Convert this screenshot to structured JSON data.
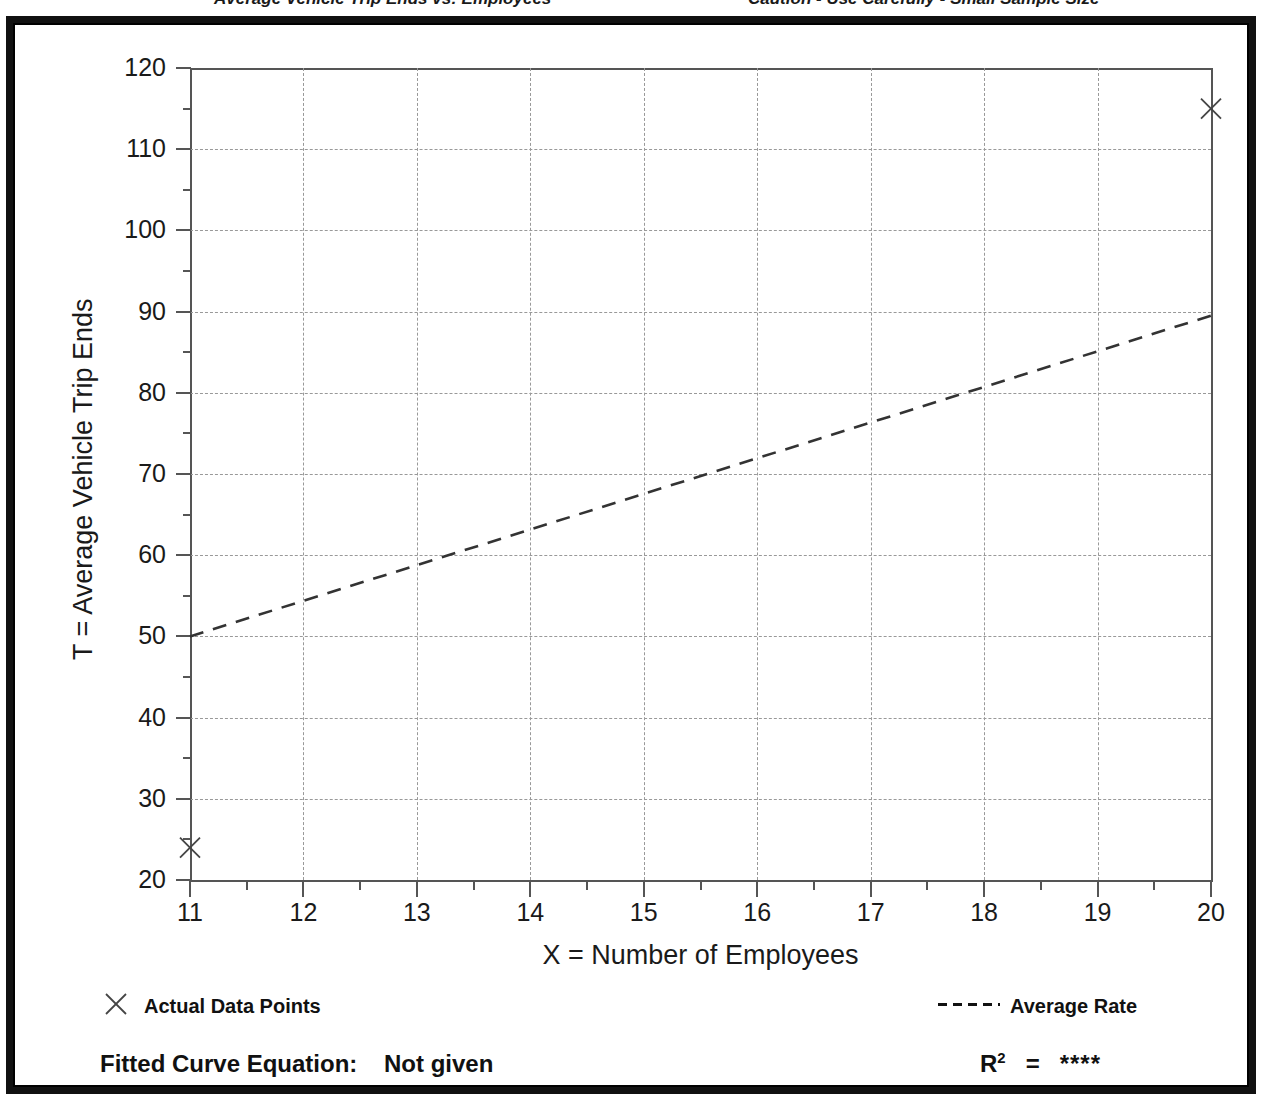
{
  "header": {
    "left_text": "Average Vehicle Trip Ends vs: Employees",
    "right_text": "Caution - Use Carefully - Small Sample Size"
  },
  "axes": {
    "y_title": "T = Average Vehicle Trip Ends",
    "x_title": "X = Number of Employees",
    "y_ticks": [
      "20",
      "30",
      "40",
      "50",
      "60",
      "70",
      "80",
      "90",
      "100",
      "110",
      "120"
    ],
    "x_ticks": [
      "11",
      "12",
      "13",
      "14",
      "15",
      "16",
      "17",
      "18",
      "19",
      "20"
    ]
  },
  "legend": {
    "data_points_label": "Actual Data Points",
    "average_rate_label": "Average Rate",
    "data_points_marker": "x-marker-icon",
    "average_rate_marker": "dashed-line-icon"
  },
  "footer": {
    "equation_label": "Fitted Curve Equation:",
    "equation_value": "Not given",
    "r2_label": "R",
    "r2_superscript": "2",
    "r2_equals": "=",
    "r2_value": "****"
  },
  "colors": {
    "axis": "#555555",
    "grid": "#999999",
    "series": "#333333",
    "frame": "#111111",
    "background": "#ffffff"
  },
  "chart_data": {
    "type": "scatter",
    "title": "",
    "xlabel": "X = Number of Employees",
    "ylabel": "T = Average Vehicle Trip Ends",
    "xlim": [
      11,
      20
    ],
    "ylim": [
      20,
      120
    ],
    "x_major_step": 1,
    "x_minor_step": 0.5,
    "y_major_step": 10,
    "y_minor_step": 5,
    "grid": true,
    "grid_style": "dashed",
    "legend_position": "below-plot",
    "series": [
      {
        "name": "Actual Data Points",
        "type": "scatter",
        "marker": "x",
        "points": [
          {
            "x": 11,
            "y": 24
          },
          {
            "x": 20,
            "y": 115
          }
        ]
      },
      {
        "name": "Average Rate",
        "type": "line",
        "style": "dashed",
        "points": [
          {
            "x": 11,
            "y": 50
          },
          {
            "x": 20,
            "y": 89.5
          }
        ]
      }
    ]
  }
}
